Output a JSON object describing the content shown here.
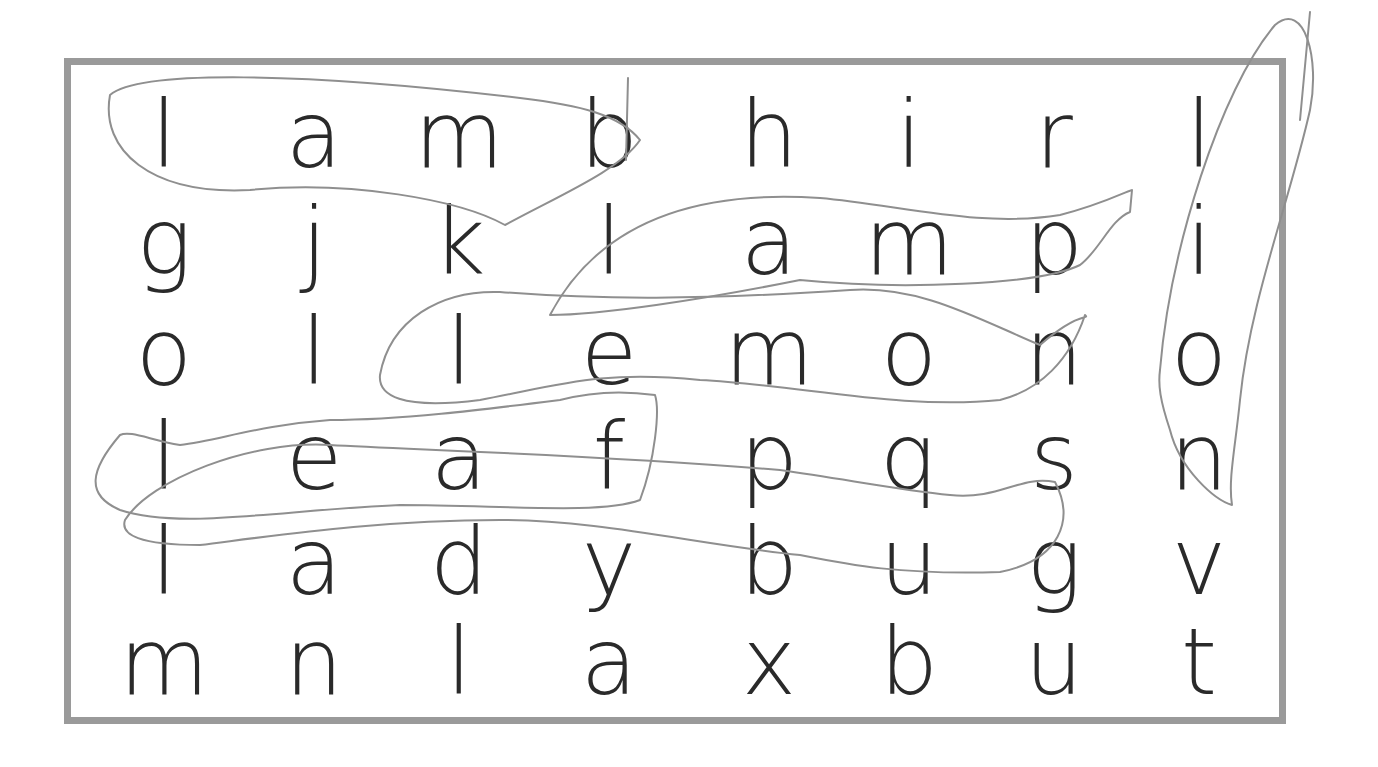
{
  "puzzle": {
    "type": "word-search",
    "rows": [
      [
        "l",
        "a",
        "m",
        "b",
        "h",
        "i",
        "r",
        "l"
      ],
      [
        "g",
        "j",
        "k",
        "l",
        "a",
        "m",
        "p",
        "i"
      ],
      [
        "o",
        "l",
        "l",
        "e",
        "m",
        "o",
        "n",
        "o"
      ],
      [
        "l",
        "e",
        "a",
        "f",
        "p",
        "q",
        "s",
        "n"
      ],
      [
        "l",
        "a",
        "d",
        "y",
        "b",
        "u",
        "g",
        "v"
      ],
      [
        "m",
        "n",
        "l",
        "a",
        "x",
        "b",
        "u",
        "t"
      ]
    ],
    "circled_words": [
      "lamb",
      "lamp",
      "lemon",
      "leaf",
      "ladybug",
      "lion",
      "bug"
    ],
    "colors": {
      "border": "#9a9a9a",
      "letters": "#2a2a2a",
      "pencil": "#8f8f8f"
    }
  }
}
